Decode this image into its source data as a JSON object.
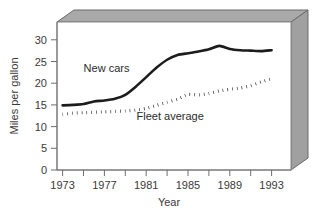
{
  "chart_data": {
    "type": "line",
    "title": "",
    "xlabel": "Year",
    "ylabel": "Miles per gallon",
    "xlim": [
      1973,
      1993
    ],
    "ylim": [
      0,
      32
    ],
    "grid": false,
    "legend_position": "inline-annotation",
    "y_ticks": [
      0,
      5,
      10,
      15,
      20,
      25,
      30
    ],
    "y_tick_labels": [
      "0",
      "5",
      "10",
      "15",
      "20",
      "25",
      "30"
    ],
    "x_ticks": [
      1973,
      1975,
      1977,
      1979,
      1981,
      1983,
      1985,
      1987,
      1989,
      1991,
      1993
    ],
    "x_tick_labels": [
      "1973",
      "",
      "1977",
      "",
      "1981",
      "",
      "1985",
      "",
      "1989",
      "",
      "1993"
    ],
    "x_labeled_ticks": [
      "1973",
      "1977",
      "1981",
      "1985",
      "1989",
      "1993"
    ],
    "x": [
      1973,
      1974,
      1975,
      1976,
      1977,
      1978,
      1979,
      1980,
      1981,
      1982,
      1983,
      1984,
      1985,
      1986,
      1987,
      1988,
      1989,
      1990,
      1991,
      1992,
      1993
    ],
    "series": [
      {
        "name": "New cars",
        "style": "solid",
        "label_x": 1977.2,
        "label_y": 22.6,
        "values": [
          14.9,
          15.0,
          15.2,
          15.8,
          16.0,
          16.4,
          17.3,
          19.2,
          21.4,
          23.6,
          25.4,
          26.5,
          26.9,
          27.3,
          27.8,
          28.6,
          27.9,
          27.6,
          27.5,
          27.4,
          27.6
        ]
      },
      {
        "name": "Fleet average",
        "style": "dotted",
        "label_x": 1983.3,
        "label_y": 11.6,
        "values": [
          12.8,
          13.1,
          13.2,
          13.3,
          13.4,
          13.5,
          13.6,
          13.8,
          14.2,
          14.9,
          15.6,
          16.3,
          17.4,
          17.3,
          17.6,
          18.2,
          18.6,
          18.9,
          19.4,
          20.3,
          21.0
        ]
      }
    ]
  },
  "axis": {
    "y_title": "Miles per gallon",
    "x_title": "Year"
  },
  "panel": {
    "background_color": "#ffffff",
    "shadow_color": "#a9a9a9",
    "border_color": "#8a8a8a"
  }
}
